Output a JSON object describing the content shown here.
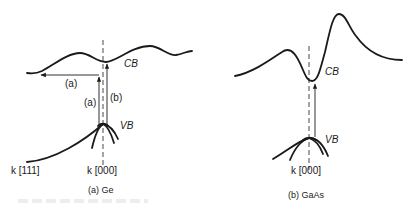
{
  "figure": {
    "panels": [
      {
        "id": "a",
        "caption": "(a)  Ge",
        "material": "Ge",
        "labels": {
          "conduction_band": "CB",
          "valence_band": "VB",
          "k_center": "k [000]",
          "k_edge": "k [111]",
          "transition_a_horizontal": "(a)",
          "transition_a_vertical": "(a)",
          "transition_b_vertical": "(b)"
        }
      },
      {
        "id": "b",
        "caption": "(b)  GaAs",
        "material": "GaAs",
        "labels": {
          "conduction_band": "CB",
          "valence_band": "VB",
          "k_center": "k [000]"
        }
      }
    ],
    "colors": {
      "ink": "#1a1a1a",
      "background": "#ffffff"
    }
  }
}
